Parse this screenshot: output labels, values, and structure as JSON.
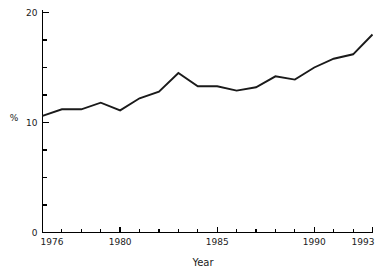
{
  "chart_data": {
    "type": "line",
    "title": "",
    "subtitle": "",
    "xlabel": "Year",
    "ylabel": "%",
    "xlim": [
      1976,
      1993
    ],
    "ylim": [
      0,
      20
    ],
    "grid": false,
    "legend": null,
    "legend_position": "none",
    "x_tick_labels": [
      "1976",
      "1980",
      "1985",
      "1990",
      "1993"
    ],
    "x_tick_values": [
      1976,
      1980,
      1985,
      1990,
      1993
    ],
    "x_minor_ticks": [
      1977,
      1978,
      1979,
      1981,
      1982,
      1983,
      1984,
      1986,
      1987,
      1988,
      1989,
      1991,
      1992
    ],
    "y_tick_labels": [
      "0",
      "10",
      "20"
    ],
    "y_tick_values": [
      0,
      10,
      20
    ],
    "y_minor_ticks": [
      2.5,
      5,
      7.5,
      12.5,
      15,
      17.5
    ],
    "x": [
      1976,
      1977,
      1978,
      1979,
      1980,
      1981,
      1982,
      1983,
      1984,
      1985,
      1986,
      1987,
      1988,
      1989,
      1990,
      1991,
      1992,
      1993
    ],
    "values": [
      10.6,
      11.2,
      11.2,
      11.8,
      11.1,
      12.2,
      12.8,
      14.5,
      13.3,
      13.3,
      12.9,
      13.2,
      14.2,
      13.9,
      15.0,
      15.8,
      16.2,
      18.0
    ],
    "series": [
      {
        "name": "",
        "color": "#1a1a1a",
        "values": [
          10.6,
          11.2,
          11.2,
          11.8,
          11.1,
          12.2,
          12.8,
          14.5,
          13.3,
          13.3,
          12.9,
          13.2,
          14.2,
          13.9,
          15.0,
          15.8,
          16.2,
          18.0
        ]
      }
    ],
    "annotations": []
  },
  "axes": {
    "y_label_top": "20",
    "y_label_mid": "10",
    "y_label_bottom": "0",
    "y_axis_caption": "%",
    "x_label_start": "1976",
    "x_label_1980": "1980",
    "x_label_1985": "1985",
    "x_label_1990": "1990",
    "x_label_end": "1993",
    "x_axis_caption": "Year"
  },
  "style": {
    "line_color": "#1a1a1a",
    "axis_color": "#000000",
    "text_color": "#1a1a1a",
    "background": "#ffffff"
  }
}
